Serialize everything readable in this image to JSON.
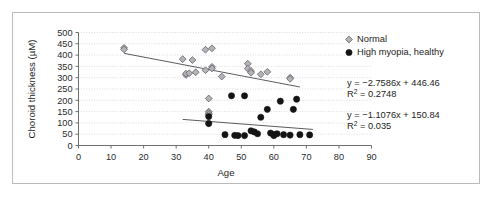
{
  "figure": {
    "border_color": "#b9bcbe",
    "background": "#ffffff"
  },
  "chart_data": {
    "type": "scatter",
    "title": "",
    "xlabel": "Age",
    "ylabel": "Choroid thickness (µM)",
    "xlim": [
      0,
      90
    ],
    "ylim": [
      0,
      500
    ],
    "xticks": [
      0,
      10,
      20,
      30,
      40,
      50,
      60,
      70,
      80,
      90
    ],
    "yticks": [
      0,
      50,
      100,
      150,
      200,
      250,
      300,
      350,
      400,
      450,
      500
    ],
    "grid": "horizontal-dotted",
    "legend_position": "top-right",
    "series": [
      {
        "name": "Normal",
        "marker": "diamond",
        "color": "#b6b3b8",
        "edge_color": "#6e6b72",
        "points": [
          [
            14,
            432
          ],
          [
            14,
            425
          ],
          [
            32,
            382
          ],
          [
            33,
            312
          ],
          [
            33,
            318
          ],
          [
            34,
            320
          ],
          [
            35,
            378
          ],
          [
            36,
            324
          ],
          [
            39,
            424
          ],
          [
            39,
            333
          ],
          [
            40,
            208
          ],
          [
            40,
            150
          ],
          [
            40,
            143
          ],
          [
            40,
            136
          ],
          [
            40,
            100
          ],
          [
            41,
            430
          ],
          [
            41,
            348
          ],
          [
            41,
            341
          ],
          [
            44,
            305
          ],
          [
            52,
            362
          ],
          [
            52,
            340
          ],
          [
            53,
            330
          ],
          [
            53,
            322
          ],
          [
            56,
            315
          ],
          [
            58,
            326
          ],
          [
            65,
            300
          ],
          [
            65,
            295
          ]
        ]
      },
      {
        "name": "High myopia, healthy",
        "marker": "circle",
        "color": "#141414",
        "points": [
          [
            40,
            128
          ],
          [
            40,
            97
          ],
          [
            45,
            48
          ],
          [
            47,
            220
          ],
          [
            48,
            45
          ],
          [
            49,
            44
          ],
          [
            51,
            220
          ],
          [
            51,
            44
          ],
          [
            53,
            65
          ],
          [
            54,
            60
          ],
          [
            55,
            52
          ],
          [
            56,
            125
          ],
          [
            58,
            160
          ],
          [
            59,
            55
          ],
          [
            60,
            48
          ],
          [
            60,
            44
          ],
          [
            61,
            52
          ],
          [
            62,
            196
          ],
          [
            63,
            48
          ],
          [
            65,
            46
          ],
          [
            66,
            160
          ],
          [
            67,
            205
          ],
          [
            68,
            48
          ],
          [
            71,
            47
          ]
        ]
      }
    ],
    "trendlines": [
      {
        "series": "Normal",
        "slope": -2.7586,
        "intercept": 446.46,
        "r2": 0.2748,
        "equation": "y = −2.7586x + 446.46",
        "r2_label": "R",
        "r2_exp": "2",
        "r2_value": " = 0.2748",
        "x_start": 14,
        "x_end": 68
      },
      {
        "series": "High myopia, healthy",
        "slope": -1.1076,
        "intercept": 150.84,
        "r2": 0.035,
        "equation": "y = −1.1076x + 150.84",
        "r2_label": "R",
        "r2_exp": "2",
        "r2_value": " = 0.035",
        "x_start": 32,
        "x_end": 72
      }
    ]
  },
  "legend": {
    "items": [
      {
        "label": "Normal",
        "marker": "diamond",
        "color": "#b6b3b8"
      },
      {
        "label": "High myopia, healthy",
        "marker": "circle",
        "color": "#141414"
      }
    ]
  },
  "annotations": {
    "eq1_line1": "y = −2.7586x + 446.46",
    "eq1_r": "R",
    "eq1_sup": "2",
    "eq1_rest": " = 0.2748",
    "eq2_line1": "y = −1.1076x + 150.84",
    "eq2_r": "R",
    "eq2_sup": "2",
    "eq2_rest": " = 0.035"
  }
}
